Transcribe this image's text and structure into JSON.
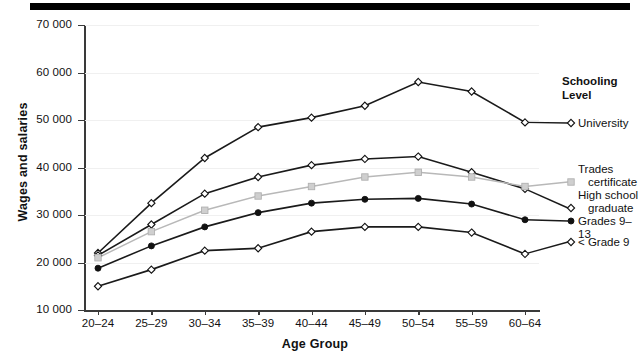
{
  "chart_data": {
    "type": "line",
    "title": "",
    "xlabel": "Age Group",
    "ylabel": "Wages and salaries",
    "categories": [
      "20–24",
      "25–29",
      "30–34",
      "35–39",
      "40–44",
      "45–49",
      "50–54",
      "55–59",
      "60–64"
    ],
    "ylim": [
      10000,
      70000
    ],
    "yticks": [
      10000,
      20000,
      30000,
      40000,
      50000,
      60000,
      70000
    ],
    "ytick_labels": [
      "10 000",
      "20 000",
      "30 000",
      "40 000",
      "50 000",
      "60 000",
      "70 000"
    ],
    "grid": true,
    "legend_position": "right",
    "legend_title": "Schooling Level",
    "series": [
      {
        "name": "University",
        "marker": "open-diamond",
        "color": "#1a1a1a",
        "values": [
          22000,
          32500,
          42000,
          48500,
          50500,
          53000,
          58000,
          56000,
          49500
        ]
      },
      {
        "name": "High school graduate",
        "marker": "open-diamond",
        "color": "#1a1a1a",
        "values": [
          21500,
          28000,
          34500,
          38000,
          40500,
          41800,
          42300,
          39000,
          35500
        ]
      },
      {
        "name": "Trades certificate",
        "marker": "gray-square",
        "color": "#b8b8b8",
        "values": [
          21000,
          26500,
          31000,
          34000,
          36000,
          38000,
          39000,
          38000,
          36000
        ]
      },
      {
        "name": "Grades 9–13",
        "marker": "filled-circle",
        "color": "#1a1a1a",
        "values": [
          18800,
          23500,
          27500,
          30500,
          32500,
          33300,
          33500,
          32300,
          29000
        ]
      },
      {
        "name": "< Grade 9",
        "marker": "open-diamond",
        "color": "#1a1a1a",
        "values": [
          15000,
          18500,
          22500,
          23000,
          26500,
          27500,
          27500,
          26300,
          21800
        ]
      }
    ]
  },
  "legend": {
    "title_line1": "Schooling",
    "title_line2": "Level",
    "entries": [
      {
        "label": "University",
        "marker": "open-diamond"
      },
      {
        "label": "Trades",
        "marker": "none"
      },
      {
        "label": "certificate",
        "marker": "gray-square"
      },
      {
        "label": "High school",
        "marker": "none"
      },
      {
        "label": "graduate",
        "marker": "open-diamond"
      },
      {
        "label": "Grades 9–13",
        "marker": "filled-circle"
      },
      {
        "label": "< Grade 9",
        "marker": "open-diamond"
      }
    ]
  }
}
